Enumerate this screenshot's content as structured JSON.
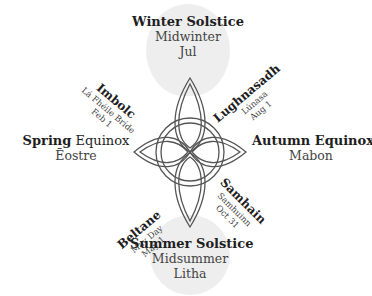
{
  "diagram": {
    "center_symbol": "celtic-knot-icon",
    "colors": {
      "text": "#1e1e1e",
      "subtext": "#444444",
      "blob": "#eeeeee",
      "knot_stroke": "#555555"
    },
    "festivals": {
      "winter": {
        "name": "Winter Solstice",
        "alt": "Midwinter",
        "alt2": "Jul"
      },
      "imbolc": {
        "name": "Imbolc",
        "alt": "Lá Fhéile Bríde",
        "date": "Feb 1"
      },
      "lughnasadh": {
        "name": "Lughnasadh",
        "alt": "Lúnasa",
        "date": "Aug 1"
      },
      "spring": {
        "name_bold": "Spring",
        "name_rest": " Equinox",
        "alt": "Ēostre"
      },
      "autumn": {
        "name_bold": "Autumn",
        "name_rest": " Equinox",
        "alt": "Mabon"
      },
      "beltane": {
        "name": "Beltane",
        "alt": "May Day",
        "date": "May 1"
      },
      "samhain": {
        "name": "Samhain",
        "alt": "Samhuinn",
        "date": "Oct 31"
      },
      "summer": {
        "name": "Summer Solstice",
        "alt": "Midsummer",
        "alt2": "Litha"
      }
    }
  }
}
